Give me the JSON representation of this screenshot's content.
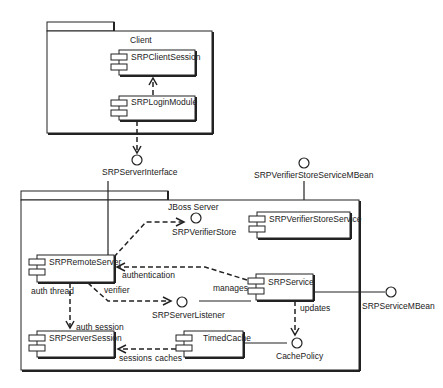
{
  "diagram": {
    "type": "UML component diagram",
    "packages": {
      "client": {
        "label": "Client"
      },
      "server": {
        "label": "JBoss Server"
      }
    },
    "components": {
      "client_session": "SRPClientSession",
      "login_module": "SRPLoginModule",
      "remote_server": "SRPRemoteServer",
      "verifier_store_service": "SRPVerifierStoreService",
      "service": "SRPService",
      "server_session": "SRPServerSession",
      "timed_cache": "TimedCache"
    },
    "interfaces": {
      "server_interface": "SRPServerInterface",
      "verifier_store_service_mbean": "SRPVerifierStoreServiceMBean",
      "verifier_store": "SRPVerifierStore",
      "server_listener": "SRPServerListener",
      "service_mbean": "SRPServiceMBean",
      "cache_policy": "CachePolicy"
    },
    "edge_labels": {
      "authentication": "authentication",
      "verifier": "verifier",
      "manages": "manages",
      "auth_thread": "auth thread",
      "auth_session": "auth session",
      "updates": "updates",
      "sessions": "sessions",
      "caches": "caches"
    }
  }
}
